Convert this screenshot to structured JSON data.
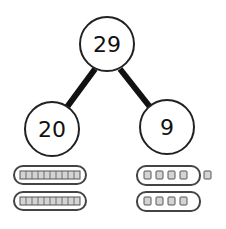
{
  "diagram": {
    "type": "number-bond",
    "whole": {
      "label": "29"
    },
    "parts": [
      {
        "label": "20",
        "tens": 2,
        "ones": 0
      },
      {
        "label": "9",
        "tens": 0,
        "ones": 9
      }
    ],
    "colors": {
      "stroke": "#222222",
      "block_fill": "#d4d4d4",
      "block_stroke": "#555555"
    }
  }
}
